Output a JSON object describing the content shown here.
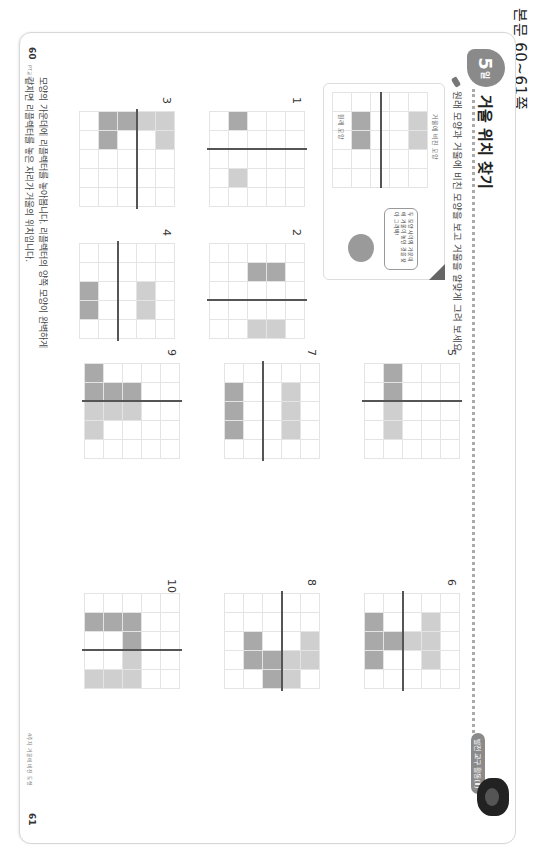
{
  "header": {
    "side_label": "본문 60~61쪽"
  },
  "lesson": {
    "day_number": "5",
    "day_suffix": "일",
    "title": "거울 위치 찾기",
    "tag": "발전 교구 활동(Ⅱ)",
    "instruction": "원래 모양과 거울에 비친 모양을 보고 거울을 알맞게 그려 보세요."
  },
  "example": {
    "original_label": "원래 모양",
    "mirror_label": "거울에 비친 모양",
    "speech": "두 모양 사이의 가운데에 거울이 놓인 것을 찾아 그려봐!"
  },
  "problems": [
    {
      "number": "1",
      "cells": "0000000000000000000000000",
      "dark": [
        [
          3,
          0
        ]
      ],
      "light": [
        [
          3,
          3
        ]
      ],
      "mirror": {
        "orient": "v",
        "pos": 2
      }
    },
    {
      "number": "2",
      "dark": [
        [
          1,
          1
        ],
        [
          2,
          1
        ]
      ],
      "light": [
        [
          1,
          4
        ],
        [
          2,
          4
        ]
      ],
      "mirror": {
        "orient": "v",
        "pos": 3
      }
    },
    {
      "number": "3",
      "dark": [
        [
          2,
          0
        ],
        [
          3,
          0
        ],
        [
          3,
          1
        ]
      ],
      "light": [
        [
          0,
          0
        ],
        [
          0,
          1
        ],
        [
          1,
          0
        ]
      ],
      "mirror": {
        "orient": "h",
        "pos": 2
      }
    },
    {
      "number": "4",
      "dark": [
        [
          4,
          2
        ],
        [
          4,
          3
        ]
      ],
      "light": [
        [
          1,
          2
        ],
        [
          1,
          3
        ]
      ],
      "mirror": {
        "orient": "h",
        "pos": 3
      }
    },
    {
      "number": "5",
      "dark": [
        [
          3,
          0
        ],
        [
          3,
          1
        ]
      ],
      "light": [
        [
          3,
          2
        ],
        [
          3,
          3
        ]
      ],
      "mirror": {
        "orient": "v",
        "pos": 2
      }
    },
    {
      "number": "6",
      "dark": [
        [
          3,
          2
        ],
        [
          4,
          1
        ],
        [
          4,
          2
        ],
        [
          4,
          3
        ]
      ],
      "light": [
        [
          1,
          1
        ],
        [
          1,
          2
        ],
        [
          1,
          3
        ],
        [
          2,
          2
        ]
      ],
      "mirror": {
        "orient": "h",
        "pos": 3
      }
    },
    {
      "number": "7",
      "dark": [
        [
          4,
          1
        ],
        [
          4,
          2
        ],
        [
          4,
          3
        ]
      ],
      "light": [
        [
          1,
          1
        ],
        [
          1,
          2
        ],
        [
          1,
          3
        ]
      ],
      "mirror": {
        "orient": "h",
        "pos": 3
      }
    },
    {
      "number": "8",
      "dark": [
        [
          2,
          3
        ],
        [
          2,
          4
        ],
        [
          3,
          2
        ],
        [
          3,
          3
        ]
      ],
      "light": [
        [
          0,
          2
        ],
        [
          0,
          3
        ],
        [
          1,
          3
        ],
        [
          1,
          4
        ]
      ],
      "mirror": {
        "orient": "h",
        "pos": 2
      }
    },
    {
      "number": "9",
      "dark": [
        [
          2,
          1
        ],
        [
          3,
          1
        ],
        [
          4,
          0
        ],
        [
          4,
          1
        ]
      ],
      "light": [
        [
          2,
          2
        ],
        [
          3,
          2
        ],
        [
          4,
          2
        ],
        [
          4,
          3
        ]
      ],
      "mirror": {
        "orient": "v",
        "pos": 2
      }
    },
    {
      "number": "10",
      "dark": [
        [
          2,
          1
        ],
        [
          2,
          2
        ],
        [
          3,
          1
        ],
        [
          4,
          1
        ]
      ],
      "light": [
        [
          2,
          3
        ],
        [
          2,
          4
        ],
        [
          3,
          4
        ],
        [
          4,
          4
        ]
      ],
      "mirror": {
        "orient": "v",
        "pos": 3
      }
    }
  ],
  "tip": {
    "line1": "모양의 가운데에 리플렉터를 놓아봅니다. 리플렉터의 양쪽 모양이 완벽하게",
    "line2": "같지면 리플렉터를 놓은 자리가 거울의 위치입니다."
  },
  "footer": {
    "left_page": "60",
    "left_sub": "PT교육도서",
    "right_page": "61",
    "right_sub": "4주차 거울에 비친 도형"
  }
}
